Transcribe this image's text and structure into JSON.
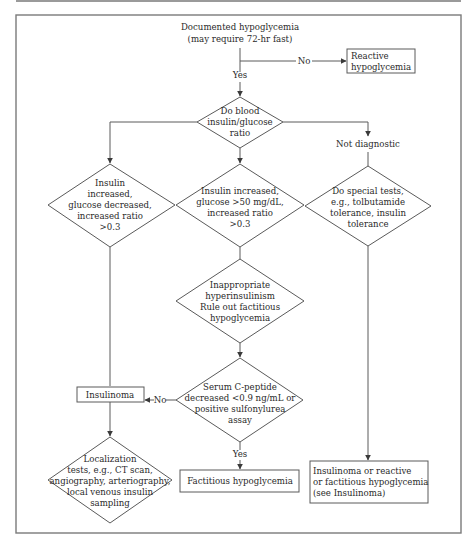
{
  "diagram": {
    "nodes": {
      "start": {
        "type": "text",
        "lines": [
          "Documented hypoglycemia",
          "(may require 72-hr fast)"
        ]
      },
      "reactive": {
        "type": "box",
        "lines": [
          "Reactive",
          "hypoglycemia"
        ]
      },
      "ratio": {
        "type": "decision",
        "lines": [
          "Do blood",
          "insulin/glucose",
          "ratio"
        ]
      },
      "insulin_glucose_dec": {
        "type": "decision",
        "lines": [
          "Insulin",
          "increased,",
          "glucose decreased,",
          "increased ratio",
          ">0.3"
        ]
      },
      "insulin_glucose_50": {
        "type": "decision",
        "lines": [
          "Insulin increased,",
          "glucose >50 mg/dL,",
          "increased ratio",
          ">0.3"
        ]
      },
      "not_diagnostic": {
        "type": "text",
        "lines": [
          "Not diagnostic"
        ]
      },
      "special_tests": {
        "type": "decision",
        "lines": [
          "Do special tests,",
          "e.g., tolbutamide",
          "tolerance, insulin",
          "tolerance"
        ]
      },
      "inappropriate": {
        "type": "decision",
        "lines": [
          "Inappropriate",
          "hyperinsulinism",
          "Rule out factitious",
          "hypoglycemia"
        ]
      },
      "cpeptide": {
        "type": "decision",
        "lines": [
          "Serum C-peptide",
          "decreased <0.9 ng/mL or",
          "positive sulfonylurea",
          "assay"
        ]
      },
      "insulinoma": {
        "type": "box",
        "lines": [
          "Insulinoma"
        ]
      },
      "localization": {
        "type": "decision",
        "lines": [
          "Localization",
          "tests, e.g., CT scan,",
          "angiography, arteriography,",
          "local venous insulin",
          "sampling"
        ]
      },
      "factitious": {
        "type": "box",
        "lines": [
          "Factitious hypoglycemia"
        ]
      },
      "insulinoma_or_reactive": {
        "type": "box",
        "lines": [
          "Insulinoma or reactive",
          "or factitious hypoglycemia",
          "(see Insulinoma)"
        ]
      }
    },
    "edge_labels": {
      "start_no": "No",
      "start_yes": "Yes",
      "cpeptide_no": "No",
      "cpeptide_yes": "Yes"
    }
  }
}
